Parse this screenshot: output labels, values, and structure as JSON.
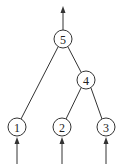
{
  "diagram": {
    "type": "tree",
    "colors": {
      "stroke": "#333333",
      "background": "#ffffff",
      "text": "#222222"
    },
    "nodes": [
      {
        "id": "n5",
        "label": "5",
        "x": 63,
        "y": 39
      },
      {
        "id": "n4",
        "label": "4",
        "x": 86,
        "y": 80
      },
      {
        "id": "n1",
        "label": "1",
        "x": 17,
        "y": 127
      },
      {
        "id": "n2",
        "label": "2",
        "x": 62,
        "y": 127
      },
      {
        "id": "n3",
        "label": "3",
        "x": 106,
        "y": 127
      }
    ],
    "edges": [
      {
        "from": "5",
        "to": "1"
      },
      {
        "from": "5",
        "to": "4"
      },
      {
        "from": "4",
        "to": "2"
      },
      {
        "from": "4",
        "to": "3"
      }
    ],
    "arrows": [
      {
        "name": "output-arrow",
        "at": "5",
        "direction": "up"
      },
      {
        "name": "input-arrow-1",
        "at": "1",
        "direction": "up"
      },
      {
        "name": "input-arrow-2",
        "at": "2",
        "direction": "up"
      },
      {
        "name": "input-arrow-3",
        "at": "3",
        "direction": "up"
      }
    ]
  }
}
